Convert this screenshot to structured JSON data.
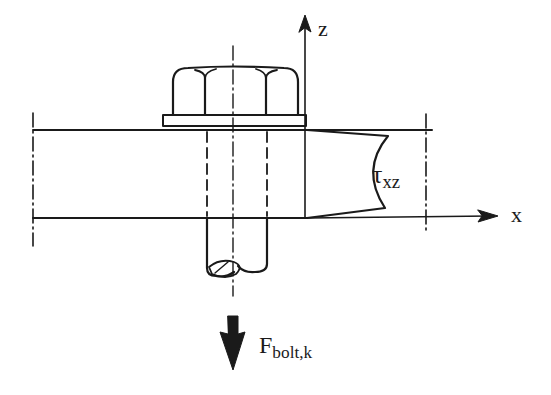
{
  "figure": {
    "axes": {
      "z_label": "z",
      "x_label": "x"
    },
    "stress_label": {
      "symbol": "τ",
      "subscript": "xz"
    },
    "force_label": {
      "symbol": "F",
      "subscript": "bolt,k"
    },
    "components": [
      "hex nut",
      "washer",
      "plate",
      "bolt shank",
      "centerline",
      "shear stress profile",
      "force arrow"
    ],
    "colors": {
      "stroke": "#1a1a1a",
      "background": "#ffffff"
    }
  }
}
